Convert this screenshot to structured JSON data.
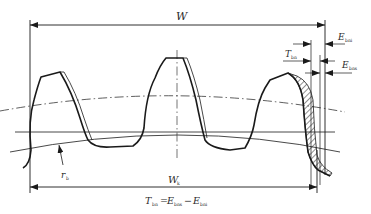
{
  "diagram": {
    "type": "gear-tooth-base-tangent-length-tolerance",
    "labels": {
      "W": {
        "main": "W",
        "sub": ""
      },
      "E_bni": {
        "main": "E",
        "sub": "bni"
      },
      "T_bn": {
        "main": "T",
        "sub": "bn"
      },
      "E_bns": {
        "main": "E",
        "sub": "bns"
      },
      "r_b": {
        "main": "r",
        "sub": "b"
      },
      "W_k": {
        "main": "W",
        "sub": "k"
      }
    },
    "formula": {
      "lhs_main": "T",
      "lhs_sub": "bn",
      "eq": "=",
      "t1_main": "E",
      "t1_sub": "bns",
      "minus": "−",
      "t2_main": "E",
      "t2_sub": "bni"
    },
    "colors": {
      "line": "#1a1a1a",
      "thin": "#333333",
      "background": "#ffffff"
    }
  }
}
